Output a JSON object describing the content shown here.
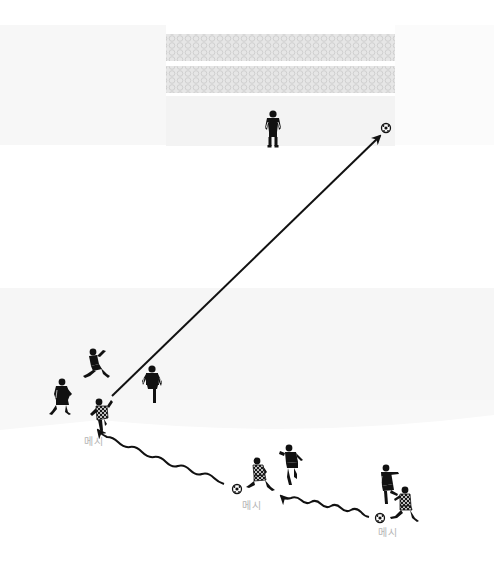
{
  "diagram": {
    "title": "",
    "colors": {
      "background": "#ffffff",
      "field_shade": "#f7f7f7",
      "net": "#e2e2e2",
      "net_cell": "#d4d4d4",
      "goal_area": "#f3f3f3",
      "ink": "#111111",
      "label": "#b4b4b4"
    },
    "goal": {
      "net_top": {
        "x": 166,
        "y": 34,
        "w": 229,
        "h": 27
      },
      "net_bottom": {
        "x": 166,
        "y": 66,
        "w": 229,
        "h": 27
      },
      "area": {
        "x": 166,
        "y": 96,
        "w": 229,
        "h": 50
      }
    },
    "players": [
      {
        "id": "goalkeeper",
        "role": "goalkeeper",
        "team": "defense",
        "x": 273,
        "y": 128
      },
      {
        "id": "defender-1",
        "role": "defender",
        "team": "defense",
        "x": 97,
        "y": 366
      },
      {
        "id": "defender-2",
        "role": "defender",
        "team": "defense",
        "x": 62,
        "y": 398
      },
      {
        "id": "defender-3",
        "role": "defender",
        "team": "defense",
        "x": 152,
        "y": 383
      },
      {
        "id": "messi-shot",
        "role": "messi",
        "team": "attack",
        "x": 102,
        "y": 416,
        "label": "메시"
      },
      {
        "id": "messi-mid",
        "role": "messi",
        "team": "attack",
        "x": 259,
        "y": 477,
        "label": "메시"
      },
      {
        "id": "defender-4",
        "role": "defender",
        "team": "defense",
        "x": 291,
        "y": 465
      },
      {
        "id": "defender-5",
        "role": "defender",
        "team": "defense",
        "x": 386,
        "y": 486
      },
      {
        "id": "messi-start",
        "role": "messi",
        "team": "attack",
        "x": 405,
        "y": 506,
        "label": "메시"
      }
    ],
    "balls": [
      {
        "id": "ball-goal",
        "x": 386,
        "y": 128
      },
      {
        "id": "ball-mid",
        "x": 237,
        "y": 489
      },
      {
        "id": "ball-start",
        "x": 380,
        "y": 518
      }
    ],
    "labels": [
      {
        "id": "label-messi-shot",
        "text": "메시",
        "x": 84,
        "y": 439
      },
      {
        "id": "label-messi-mid",
        "text": "메시",
        "x": 242,
        "y": 503
      },
      {
        "id": "label-messi-start",
        "text": "메시",
        "x": 378,
        "y": 530
      }
    ],
    "arrows": [
      {
        "id": "shot-arrow",
        "type": "straight",
        "from": [
          112,
          396
        ],
        "to": [
          382,
          134
        ]
      },
      {
        "id": "dribble-arrow-1",
        "type": "wavy",
        "from": [
          224,
          484
        ],
        "to": [
          90,
          433
        ]
      },
      {
        "id": "dribble-arrow-2",
        "type": "wavy",
        "from": [
          369,
          517
        ],
        "to": [
          287,
          502
        ]
      }
    ]
  }
}
